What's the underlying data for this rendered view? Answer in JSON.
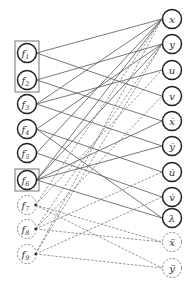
{
  "diagram": {
    "type": "bipartite-graph",
    "left_nodes": [
      {
        "id": "f1",
        "label": "f",
        "sub": "1",
        "x": 27,
        "y": 53,
        "style": "solid"
      },
      {
        "id": "f2",
        "label": "f",
        "sub": "2",
        "x": 27,
        "y": 80,
        "style": "solid"
      },
      {
        "id": "f3",
        "label": "f",
        "sub": "3",
        "x": 27,
        "y": 104,
        "style": "solid"
      },
      {
        "id": "f4",
        "label": "f",
        "sub": "4",
        "x": 27,
        "y": 129,
        "style": "solid"
      },
      {
        "id": "f5",
        "label": "f",
        "sub": "5",
        "x": 27,
        "y": 153,
        "style": "solid"
      },
      {
        "id": "f6",
        "label": "f",
        "sub": "6",
        "x": 27,
        "y": 180,
        "style": "solid"
      },
      {
        "id": "f7",
        "label": "f",
        "sub": "7",
        "x": 27,
        "y": 205,
        "style": "dashed"
      },
      {
        "id": "f8",
        "label": "f",
        "sub": "8",
        "x": 27,
        "y": 229,
        "style": "dashed"
      },
      {
        "id": "f9",
        "label": "f",
        "sub": "9",
        "x": 27,
        "y": 254,
        "style": "dashed"
      }
    ],
    "right_nodes": [
      {
        "id": "x",
        "label": "x",
        "x": 172,
        "y": 19,
        "style": "solid"
      },
      {
        "id": "y",
        "label": "y",
        "x": 172,
        "y": 44,
        "style": "solid"
      },
      {
        "id": "u",
        "label": "u",
        "x": 172,
        "y": 70,
        "style": "solid"
      },
      {
        "id": "v",
        "label": "v",
        "x": 172,
        "y": 96,
        "style": "solid"
      },
      {
        "id": "xd",
        "label": "ẋ",
        "x": 172,
        "y": 121,
        "style": "solid"
      },
      {
        "id": "yd",
        "label": "ẏ",
        "x": 172,
        "y": 146,
        "style": "solid"
      },
      {
        "id": "ud",
        "label": "u̇",
        "x": 172,
        "y": 172,
        "style": "solid"
      },
      {
        "id": "vd",
        "label": "v̇",
        "x": 172,
        "y": 197,
        "style": "solid"
      },
      {
        "id": "lam",
        "label": "λ",
        "x": 172,
        "y": 218,
        "style": "solid"
      },
      {
        "id": "xdd",
        "label": "ẍ",
        "x": 172,
        "y": 242,
        "style": "dashed"
      },
      {
        "id": "ydd",
        "label": "ÿ",
        "x": 172,
        "y": 268,
        "style": "dashed"
      }
    ],
    "groups": [
      {
        "id": "group-f1-f2",
        "x": 15,
        "y": 41,
        "w": 24,
        "h": 51
      },
      {
        "id": "group-f6",
        "x": 15,
        "y": 169,
        "w": 24,
        "h": 22
      }
    ],
    "edges_solid": [
      [
        "f1",
        "x"
      ],
      [
        "f1",
        "v"
      ],
      [
        "f2",
        "y"
      ],
      [
        "f2",
        "xd"
      ],
      [
        "f3",
        "x"
      ],
      [
        "f3",
        "u"
      ],
      [
        "f3",
        "yd"
      ],
      [
        "f4",
        "y"
      ],
      [
        "f4",
        "ud"
      ],
      [
        "f4",
        "lam"
      ],
      [
        "f5",
        "x"
      ],
      [
        "f5",
        "vd"
      ],
      [
        "f6",
        "x"
      ],
      [
        "f6",
        "y"
      ],
      [
        "f6",
        "xd"
      ],
      [
        "f6",
        "yd"
      ],
      [
        "f6",
        "lam"
      ]
    ],
    "edges_dashed": [
      [
        "f7",
        "x"
      ],
      [
        "f7",
        "u"
      ],
      [
        "f7",
        "xdd"
      ],
      [
        "f7",
        "ydd"
      ],
      [
        "f8",
        "y"
      ],
      [
        "f8",
        "v"
      ],
      [
        "f8",
        "xdd"
      ],
      [
        "f8",
        "ud"
      ],
      [
        "f9",
        "x"
      ],
      [
        "f9",
        "y"
      ],
      [
        "f9",
        "vd"
      ],
      [
        "f9",
        "ydd"
      ]
    ],
    "colors": {
      "solid_stroke": "#222222",
      "edge_stroke": "#555555",
      "dashed_stroke": "#666666"
    }
  }
}
